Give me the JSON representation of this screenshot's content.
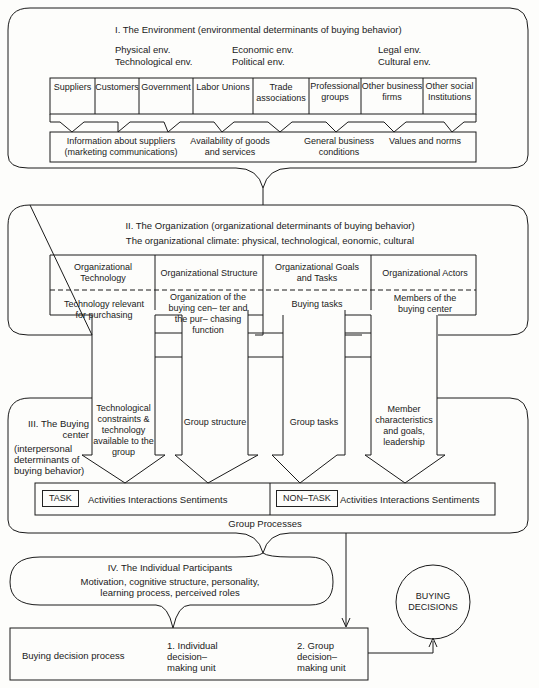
{
  "environment": {
    "title": "I. The Environment (environmental determinants of buying behavior)",
    "env_types": [
      [
        "Physical env.",
        "Economic env.",
        "Legal env."
      ],
      [
        "Technological env.",
        "Political env.",
        "Cultural env."
      ]
    ],
    "institutions": [
      "Suppliers",
      "Customers",
      "Government",
      "Labor Unions",
      "Trade associations",
      "Professional groups",
      "Other business firms",
      "Other social Institutions"
    ],
    "influences": [
      "Information about suppliers (marketing communications)",
      "Availability of goods and services",
      "General business conditions",
      "Values and norms"
    ]
  },
  "organization": {
    "title": "II. The Organization (organizational determinants of buying behavior)",
    "climate": "The organizational climate: physical, technological, eonomic, cultural",
    "columns": [
      {
        "header": "Organizational Technology",
        "detail": "Technology relevant for purchasing"
      },
      {
        "header": "Organizational Structure",
        "detail": "Organization of the buying cen– ter and the pur– chasing function"
      },
      {
        "header": "Organizational Goals and Tasks",
        "detail": "Buying tasks"
      },
      {
        "header": "Organizational Actors",
        "detail": "Members of the buying center"
      }
    ]
  },
  "buying_center": {
    "title": "III. The Buying center",
    "subtitle": "(interpersonal determinants of buying behavior)",
    "arrows": [
      "Technological constraints & technology available to the group",
      "Group structure",
      "Group tasks",
      "Member characteristics and goals, leadership"
    ],
    "task_label": "TASK",
    "task_text": "Activities Interactions Sentiments",
    "nontask_label": "NON–TASK",
    "nontask_text": "Activities Interactions Sentiments",
    "footer": "Group Processes"
  },
  "individual": {
    "title": "IV. The Individual Participants",
    "text": "Motivation, cognitive structure, personality, learning process, perceived roles"
  },
  "decision": {
    "process_label": "Buying decision process",
    "unit1": "1. Individual decision– making unit",
    "unit2": "2. Group decision– making unit",
    "outcome": "BUYING DECISIONS"
  }
}
